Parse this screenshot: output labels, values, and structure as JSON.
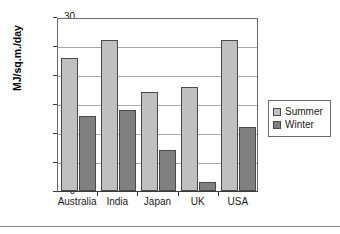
{
  "chart_data": {
    "type": "bar",
    "title": "",
    "subtitle": "",
    "xlabel": "",
    "ylabel": "MJ/sq.m./day",
    "ylim": [
      0,
      30
    ],
    "yticks": [
      0,
      5,
      10,
      15,
      20,
      25,
      30
    ],
    "ytick_labels": [
      "0",
      "5",
      "10",
      "15",
      "20",
      "25",
      "30"
    ],
    "grid": true,
    "grid_axis": "y",
    "legend_position": "right",
    "categories": [
      "Australia",
      "India",
      "Japan",
      "UK",
      "USA"
    ],
    "series": [
      {
        "name": "Summer",
        "color": "#c0c0c0",
        "values": [
          23,
          26,
          17,
          18,
          26
        ]
      },
      {
        "name": "Winter",
        "color": "#808080",
        "values": [
          13,
          14,
          7,
          1.5,
          11
        ]
      }
    ]
  },
  "legend": {
    "entries": [
      {
        "label": "Summer",
        "swatch": "legend-swatch-summer"
      },
      {
        "label": "Winter",
        "swatch": "legend-swatch-winter"
      }
    ]
  },
  "colors": {
    "summer": "#c0c0c0",
    "winter": "#808080",
    "axis": "#3a3a3a",
    "gridline": "#a9a9a9",
    "plot_background": "#ffffff",
    "page_background": "#ffffff"
  }
}
